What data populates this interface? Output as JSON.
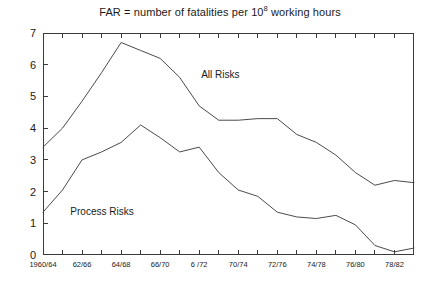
{
  "chart_data": {
    "type": "line",
    "title_prefix": "FAR = number of fatalities per 10",
    "title_exponent": "8",
    "title_suffix": " working hours",
    "xlabel": "",
    "ylabel": "",
    "ylim": [
      0,
      7
    ],
    "yticks": [
      0,
      1,
      2,
      3,
      4,
      5,
      6,
      7
    ],
    "ytick_labels": [
      "0",
      "1",
      "2",
      "3",
      "4",
      "5",
      "6",
      "7"
    ],
    "grid": false,
    "legend_position": "inline-annotations",
    "categories": [
      "1960/64",
      "61/65",
      "62/66",
      "63/67",
      "64/68",
      "65/69",
      "66/70",
      "67/71",
      "6 /72",
      "69/73",
      "70/74",
      "71/75",
      "72/76",
      "73/77",
      "74/78",
      "75/79",
      "76/80",
      "77/81",
      "78/82",
      "79/83"
    ],
    "xtick_labels_shown": [
      "1960/64",
      "",
      "62/66",
      "",
      "64/68",
      "",
      "66/70",
      "",
      "6 /72",
      "",
      "70/74",
      "",
      "72/76",
      "",
      "74/78",
      "",
      "76/80",
      "",
      "78/82",
      ""
    ],
    "series": [
      {
        "name": "All Risks",
        "color": "#4a4a4a",
        "values": [
          3.4,
          4.0,
          4.85,
          5.75,
          6.7,
          6.45,
          6.2,
          5.6,
          4.7,
          4.25,
          4.25,
          4.3,
          4.3,
          3.8,
          3.55,
          3.15,
          2.6,
          2.2,
          2.35,
          2.28
        ]
      },
      {
        "name": "Process Risks",
        "color": "#4a4a4a",
        "values": [
          1.35,
          2.05,
          3.0,
          3.25,
          3.55,
          4.1,
          3.7,
          3.25,
          3.4,
          2.6,
          2.05,
          1.85,
          1.35,
          1.2,
          1.15,
          1.25,
          0.95,
          0.3,
          0.1,
          0.22
        ]
      }
    ],
    "annotations": [
      {
        "text": "All Risks",
        "x_index": 8.1,
        "y_value": 5.85
      },
      {
        "text": "Process Risks",
        "x_index": 1.4,
        "y_value": 1.55
      }
    ]
  }
}
